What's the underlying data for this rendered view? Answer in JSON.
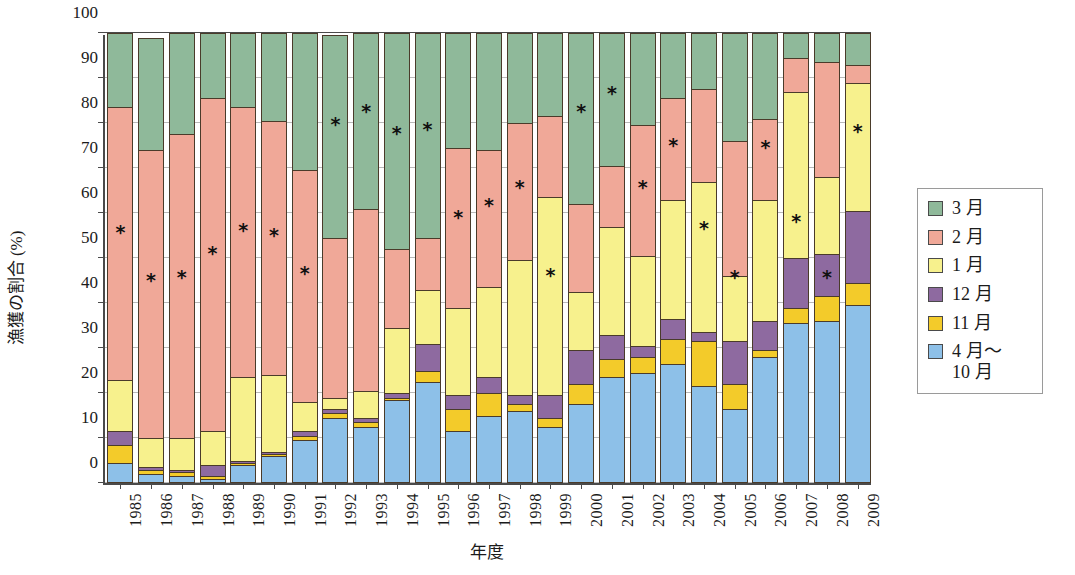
{
  "chart_data": {
    "type": "bar",
    "stacked": true,
    "title": "",
    "xlabel": "年度",
    "ylabel": "漁獲の割合 (%)",
    "ylim": [
      0,
      100
    ],
    "yticks": [
      0,
      10,
      20,
      30,
      40,
      50,
      60,
      70,
      80,
      90,
      100
    ],
    "grid": true,
    "legend_position": "right",
    "categories": [
      "1985",
      "1986",
      "1987",
      "1988",
      "1989",
      "1990",
      "1991",
      "1992",
      "1993",
      "1994",
      "1995",
      "1996",
      "1997",
      "1998",
      "1999",
      "2000",
      "2001",
      "2002",
      "2003",
      "2004",
      "2005",
      "2006",
      "2007",
      "2008",
      "2009"
    ],
    "series": [
      {
        "name": "4月〜10月",
        "color": "#8dc0e8",
        "values": [
          4.5,
          2.0,
          1.5,
          1.0,
          4.0,
          6.0,
          9.5,
          14.5,
          12.5,
          18.5,
          22.5,
          11.5,
          15.0,
          16.0,
          12.5,
          17.5,
          23.5,
          24.5,
          26.5,
          21.5,
          16.5,
          28.0,
          35.5,
          36.0,
          39.5
        ]
      },
      {
        "name": "11月",
        "color": "#f3cb2a",
        "values": [
          4.0,
          1.0,
          1.0,
          0.5,
          0.5,
          0.5,
          1.0,
          1.0,
          1.0,
          0.5,
          2.5,
          5.0,
          5.0,
          1.5,
          2.0,
          4.5,
          4.0,
          3.5,
          5.5,
          10.0,
          5.5,
          1.5,
          3.5,
          5.5,
          5.0
        ]
      },
      {
        "name": "12月",
        "color": "#8e6aa0",
        "values": [
          3.0,
          0.5,
          0.5,
          2.5,
          0.5,
          0.5,
          1.0,
          1.0,
          1.0,
          1.0,
          6.0,
          3.0,
          3.5,
          2.0,
          5.0,
          7.5,
          5.5,
          2.5,
          4.5,
          2.0,
          9.5,
          6.5,
          11.0,
          9.5,
          16.0
        ]
      },
      {
        "name": "1月",
        "color": "#f7f18d",
        "values": [
          11.5,
          6.5,
          7.0,
          7.5,
          18.5,
          17.0,
          6.5,
          2.5,
          6.0,
          14.5,
          12.0,
          19.5,
          20.0,
          30.0,
          44.0,
          13.0,
          24.0,
          20.0,
          26.5,
          33.5,
          14.5,
          27.0,
          37.0,
          17.0,
          28.5
        ]
      },
      {
        "name": "2月",
        "color": "#f0a898",
        "values": [
          60.5,
          64.0,
          67.5,
          74.0,
          60.0,
          56.5,
          51.5,
          35.5,
          40.5,
          17.5,
          11.5,
          35.5,
          30.5,
          30.5,
          18.0,
          19.5,
          13.5,
          29.0,
          22.5,
          20.5,
          30.0,
          18.0,
          7.5,
          25.5,
          4.0
        ]
      },
      {
        "name": "3月",
        "color": "#8fb99a",
        "values": [
          16.5,
          25.0,
          22.5,
          14.5,
          16.5,
          19.5,
          30.5,
          45.0,
          39.0,
          48.0,
          45.5,
          25.5,
          26.0,
          20.0,
          18.5,
          38.0,
          29.5,
          20.5,
          14.5,
          12.5,
          24.0,
          19.0,
          5.5,
          6.5,
          7.0
        ]
      }
    ],
    "marker_label": "*",
    "markers": [
      55.5,
      45.0,
      45.5,
      51.0,
      56.0,
      55.0,
      46.5,
      79.5,
      82.5,
      77.5,
      78.5,
      59.0,
      61.5,
      65.5,
      46.0,
      82.5,
      86.5,
      65.5,
      75.0,
      56.5,
      45.5,
      74.5,
      58.0,
      45.5,
      78.0
    ]
  },
  "legend": {
    "items": [
      {
        "label": "3 月",
        "color": "#8fb99a"
      },
      {
        "label": "2 月",
        "color": "#f0a898"
      },
      {
        "label": "1 月",
        "color": "#f7f18d"
      },
      {
        "label": "12 月",
        "color": "#8e6aa0"
      },
      {
        "label": "11 月",
        "color": "#f3cb2a"
      },
      {
        "label": "4 月〜\n10 月",
        "color": "#8dc0e8"
      }
    ]
  }
}
